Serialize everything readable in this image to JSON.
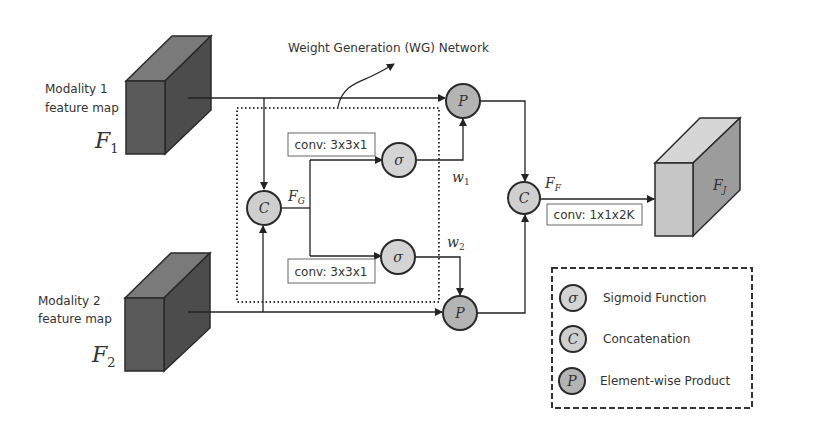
{
  "title": "Weight Generation (WG) Network",
  "inputs": [
    {
      "label_line1": "Modality 1",
      "label_line2": "feature map",
      "symbol": "F",
      "subscript": "1"
    },
    {
      "label_line1": "Modality 2",
      "label_line2": "feature map",
      "symbol": "F",
      "subscript": "2"
    }
  ],
  "output": {
    "symbol": "F",
    "subscript": "J"
  },
  "nodes": {
    "concat_g": "C",
    "sigma1": "σ",
    "sigma2": "σ",
    "product1": "P",
    "product2": "P",
    "concat_f": "C"
  },
  "features": {
    "fg": {
      "symbol": "F",
      "subscript": "G"
    },
    "ff": {
      "symbol": "F",
      "subscript": "F"
    },
    "w1": {
      "symbol": "w",
      "subscript": "1"
    },
    "w2": {
      "symbol": "w",
      "subscript": "2"
    }
  },
  "convs": {
    "conv1": "conv: 3x3x1",
    "conv2": "conv: 3x3x1",
    "conv3": "conv: 1x1x2K"
  },
  "legend": [
    {
      "symbol": "σ",
      "label": "Sigmoid Function"
    },
    {
      "symbol": "C",
      "label": "Concatenation"
    },
    {
      "symbol": "P",
      "label": "Element-wise Product"
    }
  ],
  "colors": {
    "cube_dark_front": "#5a5a5a",
    "cube_dark_top": "#7a7a7a",
    "cube_dark_side": "#4a4a4a",
    "cube_light_front": "#c8c8c8",
    "cube_light_top": "#d8d8d8",
    "cube_light_side": "#9a9a9a",
    "node_fill_light": "#d0d0d0",
    "node_fill_dark": "#b0b0b0",
    "stroke": "#2a2a2a"
  }
}
